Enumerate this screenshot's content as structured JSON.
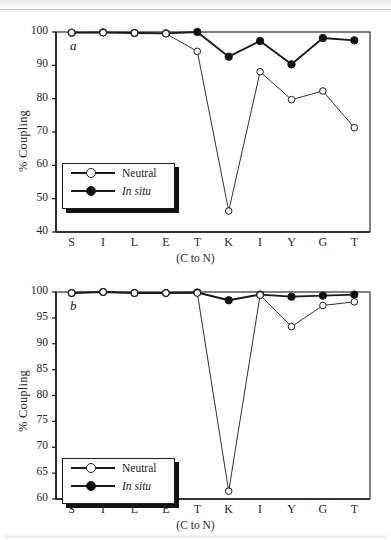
{
  "figure": {
    "ylabel": "% Coupling",
    "xlabel": "(C to N)",
    "categories": [
      "S",
      "I",
      "L",
      "E",
      "T",
      "K",
      "I",
      "Y",
      "G",
      "T"
    ],
    "series_labels": {
      "neutral": "Neutral",
      "in_situ": "In situ"
    },
    "panel_a_letter": "a",
    "panel_b_letter": "b"
  },
  "chart_data": [
    {
      "type": "line",
      "panel": "a",
      "title": "",
      "xlabel": "(C to N)",
      "ylabel": "% Coupling",
      "categories": [
        "S",
        "I",
        "L",
        "E",
        "T",
        "K",
        "I",
        "Y",
        "G",
        "T"
      ],
      "ylim": [
        40,
        100
      ],
      "yticks": [
        40,
        50,
        60,
        70,
        80,
        90,
        100
      ],
      "grid": false,
      "legend_position": "lower-left",
      "series": [
        {
          "name": "Neutral",
          "marker": "open-circle",
          "values": [
            99.8,
            99.8,
            99.7,
            99.5,
            94.2,
            46.3,
            88.1,
            79.7,
            82.3,
            71.3
          ]
        },
        {
          "name": "In situ",
          "marker": "filled-circle",
          "values": [
            99.8,
            99.9,
            99.7,
            99.6,
            100.0,
            92.6,
            97.3,
            90.3,
            98.2,
            97.5
          ]
        }
      ]
    },
    {
      "type": "line",
      "panel": "b",
      "title": "",
      "xlabel": "(C to N)",
      "ylabel": "% Coupling",
      "categories": [
        "S",
        "I",
        "L",
        "E",
        "T",
        "K",
        "I",
        "Y",
        "G",
        "T"
      ],
      "ylim": [
        60,
        100
      ],
      "yticks": [
        60,
        65,
        70,
        75,
        80,
        85,
        90,
        95,
        100
      ],
      "grid": false,
      "legend_position": "lower-left",
      "series": [
        {
          "name": "Neutral",
          "marker": "open-circle",
          "values": [
            99.8,
            100.0,
            99.8,
            99.8,
            99.8,
            61.5,
            99.4,
            93.3,
            97.4,
            98.1
          ]
        },
        {
          "name": "In situ",
          "marker": "filled-circle",
          "values": [
            99.8,
            100.0,
            99.8,
            99.8,
            99.9,
            98.4,
            99.5,
            99.1,
            99.3,
            99.5
          ]
        }
      ]
    }
  ],
  "axis_a": {
    "ticks": [
      "100",
      "90",
      "80",
      "70",
      "60",
      "50",
      "40"
    ]
  },
  "axis_b": {
    "ticks": [
      "100",
      "95",
      "90",
      "85",
      "80",
      "75",
      "70",
      "65",
      "60"
    ]
  },
  "colors": {
    "ink": "#1a1a1a",
    "marker_fill": "#111111",
    "paper": "#ffffff"
  }
}
